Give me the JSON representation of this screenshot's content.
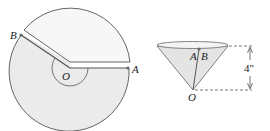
{
  "figure": {
    "left_panel": {
      "description": "Circular disk with a wedge cut out",
      "labels": {
        "center": "O",
        "point_a": "A",
        "point_b": "B"
      }
    },
    "right_panel": {
      "description": "Cone formed by joining edges OA and OB",
      "labels": {
        "apex": "O",
        "point_a": "A",
        "point_b": "B"
      },
      "height_dimension": "4\""
    },
    "colors": {
      "fill": "#e9e9e9",
      "stroke": "#555555",
      "point": "#666666"
    }
  }
}
